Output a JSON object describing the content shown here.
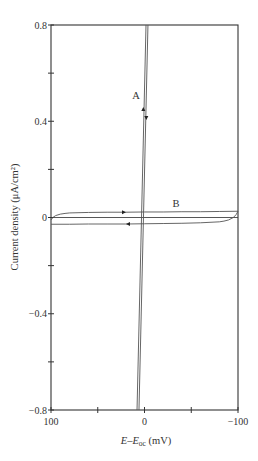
{
  "chart_data": {
    "type": "line",
    "title": "",
    "xlabel": "E–E_oc (mV)",
    "xlabel_parts": {
      "main": "E–E",
      "sub": "oc",
      "unit": " (mV)"
    },
    "ylabel": "Current density (μA/cm²)",
    "xlim": [
      100,
      -100
    ],
    "ylim": [
      -0.8,
      0.8
    ],
    "x_inverted": true,
    "x_ticks": [
      100,
      50,
      0,
      -50,
      -100
    ],
    "x_tick_labels": [
      "100",
      "",
      "0",
      "",
      "−100"
    ],
    "y_ticks": [
      0.8,
      0.6,
      0.4,
      0.2,
      0,
      -0.2,
      -0.4,
      -0.6,
      -0.8
    ],
    "y_tick_labels": [
      "0.8",
      "",
      "0.4",
      "",
      "0",
      "",
      "−0.4",
      "",
      "−0.8"
    ],
    "grid": false,
    "zero_line": true,
    "series": [
      {
        "name": "A (forward)",
        "label": "A",
        "x": [
          8.0,
          -1.6
        ],
        "y": [
          -0.8,
          0.8
        ],
        "direction": "up"
      },
      {
        "name": "A (reverse)",
        "label": "A",
        "x": [
          -3.7,
          5.9
        ],
        "y": [
          0.8,
          -0.8
        ],
        "direction": "down"
      },
      {
        "name": "B (forward)",
        "label": "B",
        "x": [
          100,
          98,
          95,
          90,
          85,
          80,
          60,
          40,
          20,
          0,
          -20,
          -40,
          -60,
          -80,
          -100
        ],
        "y": [
          -0.01,
          0.0,
          0.008,
          0.014,
          0.017,
          0.019,
          0.021,
          0.022,
          0.022,
          0.023,
          0.023,
          0.024,
          0.024,
          0.025,
          0.026
        ],
        "direction": "right"
      },
      {
        "name": "B (reverse)",
        "label": "B",
        "x": [
          -100,
          -98,
          -95,
          -90,
          -85,
          -80,
          -60,
          -40,
          -20,
          0,
          20,
          40,
          60,
          80,
          100
        ],
        "y": [
          0.026,
          0.012,
          0.0,
          -0.01,
          -0.015,
          -0.018,
          -0.022,
          -0.024,
          -0.025,
          -0.026,
          -0.027,
          -0.027,
          -0.027,
          -0.028,
          -0.028
        ],
        "direction": "left"
      }
    ],
    "annotations": [
      {
        "text": "A",
        "x": 9,
        "y": 0.5
      },
      {
        "text": "B",
        "x": -33,
        "y": 0.06
      }
    ]
  },
  "labels": {
    "curve_a": "A",
    "curve_b": "B",
    "y_axis": "Current density (μA/cm²)",
    "x_axis_main": "E–E",
    "x_axis_sub": "oc",
    "x_axis_unit": " (mV)"
  }
}
